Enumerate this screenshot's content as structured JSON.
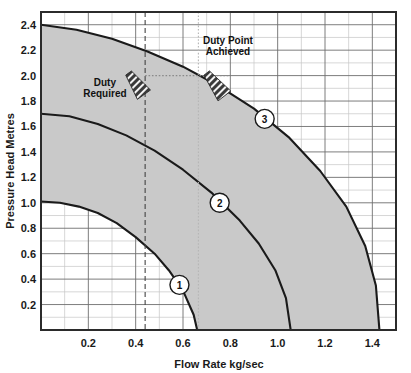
{
  "chart_data": {
    "type": "line",
    "title": "",
    "xlabel": "Flow Rate kg/sec",
    "ylabel": "Pressure Head Metres",
    "xlim": [
      0,
      1.5
    ],
    "ylim": [
      0,
      2.5
    ],
    "grid": true,
    "legend_position": "none",
    "xticks": [
      "0.2",
      "0.4",
      "0.6",
      "0.8",
      "1.0",
      "1.2",
      "1.4"
    ],
    "xtick_values": [
      0.2,
      0.4,
      0.6,
      0.8,
      1.0,
      1.2,
      1.4
    ],
    "yticks": [
      "0.2",
      "0.4",
      "0.6",
      "0.8",
      "1.0",
      "1.2",
      "1.4",
      "1.6",
      "1.8",
      "2.0",
      "2.2",
      "2.4"
    ],
    "ytick_values": [
      0.2,
      0.4,
      0.6,
      0.8,
      1.0,
      1.2,
      1.4,
      1.6,
      1.8,
      2.0,
      2.2,
      2.4
    ],
    "series": [
      {
        "name": "1",
        "label": "1",
        "marker_label": "1",
        "points": [
          [
            0.0,
            1.01
          ],
          [
            0.08,
            1.0
          ],
          [
            0.16,
            0.97
          ],
          [
            0.24,
            0.92
          ],
          [
            0.32,
            0.84
          ],
          [
            0.4,
            0.73
          ],
          [
            0.48,
            0.6
          ],
          [
            0.54,
            0.47
          ],
          [
            0.6,
            0.31
          ],
          [
            0.645,
            0.12
          ],
          [
            0.66,
            0.0
          ]
        ]
      },
      {
        "name": "2",
        "label": "2",
        "marker_label": "2",
        "points": [
          [
            0.0,
            1.7
          ],
          [
            0.12,
            1.68
          ],
          [
            0.24,
            1.62
          ],
          [
            0.36,
            1.53
          ],
          [
            0.48,
            1.41
          ],
          [
            0.6,
            1.26
          ],
          [
            0.72,
            1.08
          ],
          [
            0.84,
            0.86
          ],
          [
            0.92,
            0.68
          ],
          [
            0.99,
            0.47
          ],
          [
            1.035,
            0.25
          ],
          [
            1.055,
            0.0
          ]
        ]
      },
      {
        "name": "3",
        "label": "3",
        "marker_label": "3",
        "points": [
          [
            0.0,
            2.4
          ],
          [
            0.15,
            2.36
          ],
          [
            0.3,
            2.29
          ],
          [
            0.45,
            2.19
          ],
          [
            0.6,
            2.07
          ],
          [
            0.75,
            1.92
          ],
          [
            0.9,
            1.74
          ],
          [
            1.05,
            1.51
          ],
          [
            1.18,
            1.25
          ],
          [
            1.29,
            0.97
          ],
          [
            1.37,
            0.66
          ],
          [
            1.415,
            0.35
          ],
          [
            1.43,
            0.0
          ]
        ]
      }
    ],
    "bands": [
      {
        "name": "band-1-2",
        "lower_series": "1",
        "upper_series": "2",
        "fill": "#c9c9c9"
      },
      {
        "name": "band-2-3",
        "lower_series": "2",
        "upper_series": "3",
        "fill": "#c9c9c9"
      }
    ],
    "annotations": [
      {
        "name": "duty-required",
        "text_line_1": "Duty",
        "text_line_2": "Required",
        "text_x": 0.27,
        "text_y": 1.92,
        "arrow_from": [
          0.37,
          2.02
        ],
        "arrow_to": [
          0.435,
          1.85
        ]
      },
      {
        "name": "duty-point-achieved",
        "text_line_1": "Duty Point",
        "text_line_2": "Achieved",
        "text_x": 0.79,
        "text_y": 2.25,
        "arrow_from": [
          0.7,
          2.02
        ],
        "arrow_to": [
          0.775,
          1.84
        ]
      }
    ],
    "reference_lines": [
      {
        "name": "duty-required-vline",
        "orientation": "vertical",
        "value": 0.44,
        "style": "dashed",
        "color": "#444444"
      },
      {
        "name": "duty-achieved-vline",
        "orientation": "vertical",
        "value": 0.665,
        "style": "dotted",
        "color": "#b5b5b5"
      },
      {
        "name": "duty-hline",
        "orientation": "horizontal",
        "value": 2.0,
        "x_from": 0.44,
        "x_to": 0.8,
        "style": "dotted",
        "color": "#8a8a8a"
      }
    ]
  },
  "colors": {
    "background": "#ffffff",
    "plot_border": "#2b2b2b",
    "major_grid": "#6e6e6e",
    "minor_grid": "#c0c0c0",
    "band_fill": "#c9c9c9",
    "curve": "#1a1a1a",
    "text": "#111111"
  }
}
